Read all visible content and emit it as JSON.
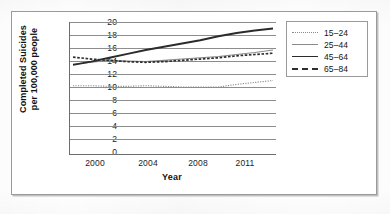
{
  "figure": {
    "border_color": "#9a9a9a",
    "background": "#ffffff"
  },
  "axis": {
    "x_title": "Year",
    "y_title_line1": "Completed Suicides",
    "y_title_line2": "per 100,000 people",
    "y_ticks": [
      "20",
      "18",
      "16",
      "14",
      "12",
      "10",
      "8",
      "6",
      "4",
      "2",
      "0"
    ],
    "x_ticks": [
      "2000",
      "2004",
      "2008",
      "2011"
    ]
  },
  "legend": {
    "items": [
      {
        "label": "15–24",
        "style": "ls-dotted-fine",
        "color": "#8a8a8a"
      },
      {
        "label": "25–44",
        "style": "ls-thin-solid",
        "color": "#8a8a8a"
      },
      {
        "label": "45–64",
        "style": "ls-thick-solid",
        "color": "#2b2b2b"
      },
      {
        "label": "65–84",
        "style": "ls-dashed-bold",
        "color": "#2f2f2f"
      }
    ]
  },
  "chart_data": {
    "type": "line",
    "title": "",
    "xlabel": "Year",
    "ylabel": "Completed Suicides per 100,000 people",
    "xlim": [
      2000,
      2011
    ],
    "ylim": [
      0,
      20
    ],
    "ytick_step": 2,
    "grid": "horizontal",
    "legend_position": "right-outside",
    "x": [
      2000,
      2001,
      2002,
      2003,
      2004,
      2005,
      2006,
      2007,
      2008,
      2009,
      2010,
      2011
    ],
    "xtick_values": [
      2000,
      2004,
      2008,
      2011
    ],
    "series": [
      {
        "name": "15–24",
        "line_style": "dotted",
        "color": "#8a8a8a",
        "values": [
          10.2,
          10.2,
          10.1,
          10.1,
          10.2,
          10.1,
          10.0,
          10.0,
          10.0,
          10.4,
          10.7,
          11.0
        ]
      },
      {
        "name": "25–44",
        "line_style": "solid-thin",
        "color": "#8a8a8a",
        "values": [
          13.5,
          13.8,
          14.1,
          14.0,
          13.9,
          14.1,
          14.3,
          14.5,
          14.7,
          15.0,
          15.3,
          15.7
        ]
      },
      {
        "name": "45–64",
        "line_style": "solid-thick",
        "color": "#2b2b2b",
        "values": [
          13.4,
          13.9,
          14.5,
          15.1,
          15.7,
          16.2,
          16.7,
          17.2,
          17.8,
          18.3,
          18.7,
          19.0
        ]
      },
      {
        "name": "65–84",
        "line_style": "dashed",
        "color": "#2f2f2f",
        "values": [
          14.6,
          14.3,
          14.1,
          13.9,
          13.8,
          13.9,
          14.1,
          14.3,
          14.5,
          14.8,
          15.0,
          15.2
        ]
      }
    ]
  }
}
